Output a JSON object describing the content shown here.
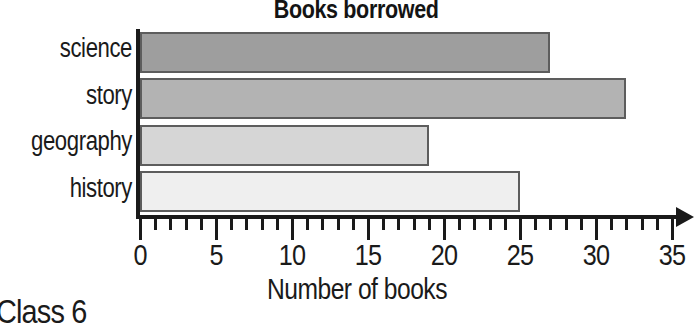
{
  "chart_data": {
    "type": "bar",
    "orientation": "horizontal",
    "title": "Books borrowed",
    "xlabel": "Number of books",
    "ylabel": "",
    "categories": [
      "science",
      "story",
      "geography",
      "history"
    ],
    "values": [
      27,
      32,
      19,
      25
    ],
    "bar_colors": [
      "#9e9e9e",
      "#b3b3b3",
      "#d6d6d6",
      "#efefef"
    ],
    "bar_border_color": "#5d5d5d",
    "xlim": [
      0,
      35
    ],
    "xticks": [
      0,
      5,
      10,
      15,
      20,
      25,
      30,
      35
    ],
    "xtick_labels": [
      "0",
      "5",
      "10",
      "15",
      "20",
      "25",
      "30",
      "35"
    ],
    "minor_tick_step": 1,
    "grid": false,
    "legend": null,
    "axis_color": "#1a1a1a"
  },
  "footer": {
    "fragment": "Class 6"
  }
}
